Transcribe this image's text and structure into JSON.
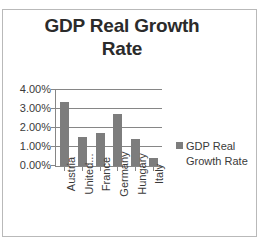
{
  "chart_data": {
    "type": "bar",
    "title": "GDP Real Growth Rate",
    "title_line1": "GDP Real Growth",
    "title_line2": "Rate",
    "categories": [
      "Austria",
      "United...",
      "France",
      "Germany",
      "Hungary",
      "Italy"
    ],
    "values": [
      3.3,
      1.5,
      1.7,
      2.7,
      1.4,
      0.4
    ],
    "series": [
      {
        "name": "GDP Real Growth Rate",
        "values": [
          3.3,
          1.5,
          1.7,
          2.7,
          1.4,
          0.4
        ]
      }
    ],
    "xlabel": "",
    "ylabel": "",
    "ylim": [
      0,
      4
    ],
    "ytick_labels": [
      "4.00%",
      "3.00%",
      "2.00%",
      "1.00%",
      "0.00%"
    ],
    "ytick_values": [
      4,
      3,
      2,
      1,
      0
    ],
    "value_format": "percent",
    "grid": true,
    "legend_position": "right",
    "legend_entries": [
      "GDP Real Growth Rate"
    ],
    "legend_label_line1": "GDP Real",
    "legend_label_line2": "Growth Rate",
    "bar_color": "#7d7d7d",
    "grid_color": "#868686",
    "text_color": "#3a3a3a",
    "title_color": "#2b2b2b",
    "background_color": "#ffffff",
    "border_color": "#b9b9b9"
  }
}
